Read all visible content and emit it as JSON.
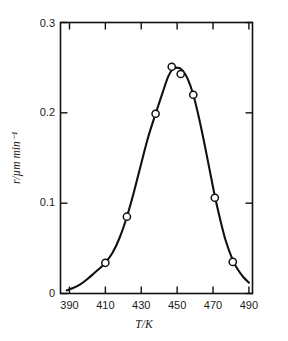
{
  "chart_data": {
    "type": "scatter",
    "title": "",
    "subtitle": "",
    "xlabel": "T/K",
    "ylabel": "r/µm min⁻¹",
    "xlim": [
      385,
      492
    ],
    "ylim": [
      0,
      0.3
    ],
    "xticks": [
      390,
      410,
      430,
      450,
      470,
      490
    ],
    "xtick_labels": [
      "390",
      "410",
      "430",
      "450",
      "470",
      "490"
    ],
    "yticks": [
      0,
      0.1,
      0.2,
      0.3
    ],
    "ytick_labels": [
      "0",
      "0.1",
      "0.2",
      "0.3"
    ],
    "grid": false,
    "legend": null,
    "legend_position": "none",
    "marker": "open-circle",
    "marker_color": "#ffffff",
    "marker_edge_color": "#111111",
    "line_color": "#111111",
    "x": [
      410,
      422,
      438,
      447,
      452,
      459,
      471,
      481
    ],
    "values": [
      0.034,
      0.085,
      0.199,
      0.251,
      0.243,
      0.22,
      0.106,
      0.035
    ],
    "points": [
      {
        "x": 410,
        "y": 0.034
      },
      {
        "x": 422,
        "y": 0.085
      },
      {
        "x": 438,
        "y": 0.199
      },
      {
        "x": 447,
        "y": 0.251
      },
      {
        "x": 452,
        "y": 0.243
      },
      {
        "x": 459,
        "y": 0.22
      },
      {
        "x": 471,
        "y": 0.106
      },
      {
        "x": 481,
        "y": 0.035
      }
    ],
    "curve": [
      {
        "x": 388.5,
        "y": 0.0035
      },
      {
        "x": 392,
        "y": 0.006
      },
      {
        "x": 396,
        "y": 0.01
      },
      {
        "x": 400,
        "y": 0.016
      },
      {
        "x": 404,
        "y": 0.023
      },
      {
        "x": 408,
        "y": 0.03
      },
      {
        "x": 410,
        "y": 0.034
      },
      {
        "x": 414,
        "y": 0.045
      },
      {
        "x": 418,
        "y": 0.062
      },
      {
        "x": 422,
        "y": 0.085
      },
      {
        "x": 426,
        "y": 0.113
      },
      {
        "x": 430,
        "y": 0.144
      },
      {
        "x": 434,
        "y": 0.174
      },
      {
        "x": 438,
        "y": 0.199
      },
      {
        "x": 442,
        "y": 0.223
      },
      {
        "x": 445,
        "y": 0.24
      },
      {
        "x": 447,
        "y": 0.247
      },
      {
        "x": 450,
        "y": 0.25
      },
      {
        "x": 453,
        "y": 0.247
      },
      {
        "x": 456,
        "y": 0.237
      },
      {
        "x": 459,
        "y": 0.22
      },
      {
        "x": 462,
        "y": 0.196
      },
      {
        "x": 465,
        "y": 0.168
      },
      {
        "x": 468,
        "y": 0.138
      },
      {
        "x": 471,
        "y": 0.108
      },
      {
        "x": 474,
        "y": 0.082
      },
      {
        "x": 477,
        "y": 0.059
      },
      {
        "x": 481,
        "y": 0.037
      },
      {
        "x": 484,
        "y": 0.026
      },
      {
        "x": 487,
        "y": 0.018
      },
      {
        "x": 490,
        "y": 0.012
      }
    ]
  },
  "axes": {
    "y_top_label": "0.3",
    "y_mid_upper_label": "0.2",
    "y_mid_lower_label": "0.1",
    "y_zero_label": "0",
    "x_labels": [
      "390",
      "410",
      "430",
      "450",
      "470",
      "490"
    ],
    "x_title": "T/K",
    "y_title": "r/µm min⁻¹"
  }
}
